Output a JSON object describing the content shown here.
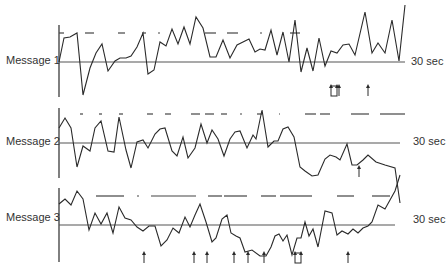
{
  "chart_data": {
    "type": "line",
    "title": "",
    "reference_label": "30 sec",
    "panels": [
      {
        "name": "Message 1",
        "label": "Message 1",
        "ref_label": "30 sec",
        "axis": {
          "x": 59,
          "y_top": 25,
          "y_bottom": 97
        },
        "baseline_y": 62,
        "baseline_x_end": 405,
        "dash_y": 33,
        "dashes": [
          [
            59,
            64
          ],
          [
            85,
            94
          ],
          [
            118,
            125
          ],
          [
            142,
            146
          ],
          [
            158,
            160
          ],
          [
            205,
            216
          ],
          [
            227,
            238
          ],
          [
            260,
            262
          ],
          [
            290,
            300
          ]
        ],
        "points": [
          [
            59,
            62
          ],
          [
            64,
            38
          ],
          [
            70,
            37
          ],
          [
            77,
            33
          ],
          [
            83,
            95
          ],
          [
            90,
            68
          ],
          [
            96,
            53
          ],
          [
            102,
            44
          ],
          [
            108,
            71
          ],
          [
            115,
            61
          ],
          [
            120,
            58
          ],
          [
            126,
            58
          ],
          [
            131,
            56
          ],
          [
            137,
            47
          ],
          [
            143,
            33
          ],
          [
            148,
            74
          ],
          [
            154,
            70
          ],
          [
            160,
            42
          ],
          [
            166,
            46
          ],
          [
            172,
            29
          ],
          [
            178,
            44
          ],
          [
            184,
            27
          ],
          [
            190,
            44
          ],
          [
            196,
            17
          ],
          [
            203,
            28
          ],
          [
            210,
            57
          ],
          [
            216,
            57
          ],
          [
            223,
            40
          ],
          [
            230,
            58
          ],
          [
            237,
            45
          ],
          [
            243,
            42
          ],
          [
            249,
            39
          ],
          [
            255,
            52
          ],
          [
            260,
            49
          ],
          [
            265,
            50
          ],
          [
            271,
            30
          ],
          [
            277,
            55
          ],
          [
            283,
            32
          ],
          [
            289,
            62
          ],
          [
            295,
            20
          ],
          [
            301,
            72
          ],
          [
            307,
            48
          ],
          [
            313,
            71
          ],
          [
            319,
            38
          ],
          [
            325,
            66
          ],
          [
            331,
            51
          ],
          [
            337,
            53
          ],
          [
            343,
            45
          ],
          [
            349,
            44
          ],
          [
            355,
            55
          ],
          [
            365,
            12
          ],
          [
            372,
            53
          ],
          [
            378,
            43
          ],
          [
            385,
            53
          ],
          [
            392,
            20
          ],
          [
            399,
            61
          ],
          [
            405,
            5
          ]
        ],
        "arrows": [
          {
            "x": 334,
            "y": 96,
            "type": "double-hollow"
          },
          {
            "x": 339,
            "y": 96,
            "type": "single"
          },
          {
            "x": 368,
            "y": 96,
            "type": "single"
          }
        ]
      },
      {
        "name": "Message 2",
        "label": "Message 2",
        "ref_label": "30 sec",
        "axis": {
          "x": 59,
          "y_top": 108,
          "y_bottom": 178
        },
        "baseline_y": 143,
        "baseline_x_end": 400,
        "dash_y": 114,
        "dashes": [
          [
            80,
            83
          ],
          [
            99,
            102
          ],
          [
            119,
            123
          ],
          [
            147,
            153
          ],
          [
            165,
            171
          ],
          [
            191,
            200
          ],
          [
            205,
            214
          ],
          [
            221,
            227
          ],
          [
            240,
            242
          ],
          [
            257,
            262
          ],
          [
            279,
            280
          ],
          [
            305,
            316
          ],
          [
            320,
            330
          ],
          [
            351,
            369
          ],
          [
            380,
            405
          ]
        ],
        "points": [
          [
            59,
            128
          ],
          [
            65,
            118
          ],
          [
            71,
            128
          ],
          [
            77,
            167
          ],
          [
            83,
            146
          ],
          [
            90,
            151
          ],
          [
            95,
            128
          ],
          [
            101,
            121
          ],
          [
            108,
            151
          ],
          [
            114,
            152
          ],
          [
            119,
            117
          ],
          [
            126,
            150
          ],
          [
            131,
            168
          ],
          [
            137,
            142
          ],
          [
            143,
            140
          ],
          [
            148,
            148
          ],
          [
            155,
            134
          ],
          [
            160,
            129
          ],
          [
            165,
            128
          ],
          [
            172,
            151
          ],
          [
            177,
            156
          ],
          [
            183,
            137
          ],
          [
            188,
            158
          ],
          [
            195,
            148
          ],
          [
            201,
            124
          ],
          [
            207,
            143
          ],
          [
            212,
            130
          ],
          [
            218,
            139
          ],
          [
            224,
            156
          ],
          [
            230,
            139
          ],
          [
            235,
            132
          ],
          [
            240,
            131
          ],
          [
            247,
            148
          ],
          [
            253,
            135
          ],
          [
            256,
            139
          ],
          [
            262,
            110
          ],
          [
            268,
            147
          ],
          [
            274,
            141
          ],
          [
            278,
            141
          ],
          [
            283,
            129
          ],
          [
            288,
            127
          ],
          [
            294,
            137
          ],
          [
            300,
            167
          ],
          [
            305,
            171
          ],
          [
            312,
            176
          ],
          [
            318,
            175
          ],
          [
            325,
            159
          ],
          [
            330,
            155
          ],
          [
            336,
            157
          ],
          [
            340,
            160
          ],
          [
            347,
            144
          ],
          [
            352,
            165
          ],
          [
            357,
            165
          ],
          [
            363,
            160
          ],
          [
            368,
            155
          ],
          [
            376,
            162
          ],
          [
            385,
            165
          ],
          [
            395,
            168
          ],
          [
            400,
            203
          ]
        ],
        "arrows": [
          {
            "x": 359,
            "y": 177,
            "type": "single"
          }
        ]
      },
      {
        "name": "Message 3",
        "label": "Message 3",
        "ref_label": "30 sec",
        "axis": {
          "x": 59,
          "y_top": 188,
          "y_bottom": 262
        },
        "baseline_y": 225,
        "baseline_x_end": 395,
        "dash_y": 196,
        "dashes": [
          [
            96,
            124
          ],
          [
            137,
            139
          ],
          [
            151,
            196
          ],
          [
            208,
            222
          ],
          [
            224,
            247
          ],
          [
            261,
            276
          ],
          [
            280,
            312
          ],
          [
            337,
            354
          ],
          [
            372,
            390
          ]
        ],
        "points": [
          [
            59,
            204
          ],
          [
            65,
            199
          ],
          [
            71,
            205
          ],
          [
            77,
            191
          ],
          [
            83,
            199
          ],
          [
            89,
            230
          ],
          [
            95,
            213
          ],
          [
            101,
            224
          ],
          [
            107,
            213
          ],
          [
            113,
            233
          ],
          [
            119,
            207
          ],
          [
            125,
            218
          ],
          [
            131,
            220
          ],
          [
            137,
            227
          ],
          [
            143,
            231
          ],
          [
            149,
            226
          ],
          [
            155,
            226
          ],
          [
            161,
            246
          ],
          [
            167,
            240
          ],
          [
            173,
            228
          ],
          [
            179,
            233
          ],
          [
            185,
            217
          ],
          [
            190,
            227
          ],
          [
            195,
            215
          ],
          [
            200,
            204
          ],
          [
            206,
            222
          ],
          [
            212,
            242
          ],
          [
            216,
            238
          ],
          [
            222,
            219
          ],
          [
            227,
            215
          ],
          [
            231,
            233
          ],
          [
            236,
            236
          ],
          [
            240,
            238
          ],
          [
            245,
            252
          ],
          [
            252,
            250
          ],
          [
            260,
            256
          ],
          [
            266,
            256
          ],
          [
            271,
            247
          ],
          [
            275,
            236
          ],
          [
            279,
            234
          ],
          [
            283,
            241
          ],
          [
            287,
            235
          ],
          [
            292,
            255
          ],
          [
            297,
            238
          ],
          [
            301,
            238
          ],
          [
            305,
            222
          ],
          [
            309,
            236
          ],
          [
            313,
            229
          ],
          [
            318,
            247
          ],
          [
            325,
            211
          ],
          [
            332,
            213
          ],
          [
            337,
            235
          ],
          [
            342,
            231
          ],
          [
            348,
            234
          ],
          [
            353,
            229
          ],
          [
            358,
            233
          ],
          [
            363,
            228
          ],
          [
            368,
            226
          ],
          [
            372,
            222
          ],
          [
            378,
            205
          ],
          [
            385,
            209
          ],
          [
            395,
            191
          ],
          [
            400,
            175
          ]
        ],
        "arrows": [
          {
            "x": 144,
            "y": 263,
            "type": "single"
          },
          {
            "x": 194,
            "y": 263,
            "type": "single"
          },
          {
            "x": 207,
            "y": 263,
            "type": "single"
          },
          {
            "x": 234,
            "y": 263,
            "type": "single"
          },
          {
            "x": 248,
            "y": 263,
            "type": "single"
          },
          {
            "x": 264,
            "y": 263,
            "type": "single"
          },
          {
            "x": 298,
            "y": 263,
            "type": "double-hollow"
          },
          {
            "x": 348,
            "y": 263,
            "type": "single"
          }
        ]
      }
    ],
    "colors": {
      "line": "#2a2a2a",
      "baseline": "#555555",
      "dash": "#444444",
      "text": "#333333"
    }
  },
  "labels": {
    "message_1": "Message 1",
    "message_2": "Message 2",
    "message_3": "Message 3",
    "sec_1": "30 sec",
    "sec_2": "30 sec",
    "sec_3": "30 sec"
  }
}
